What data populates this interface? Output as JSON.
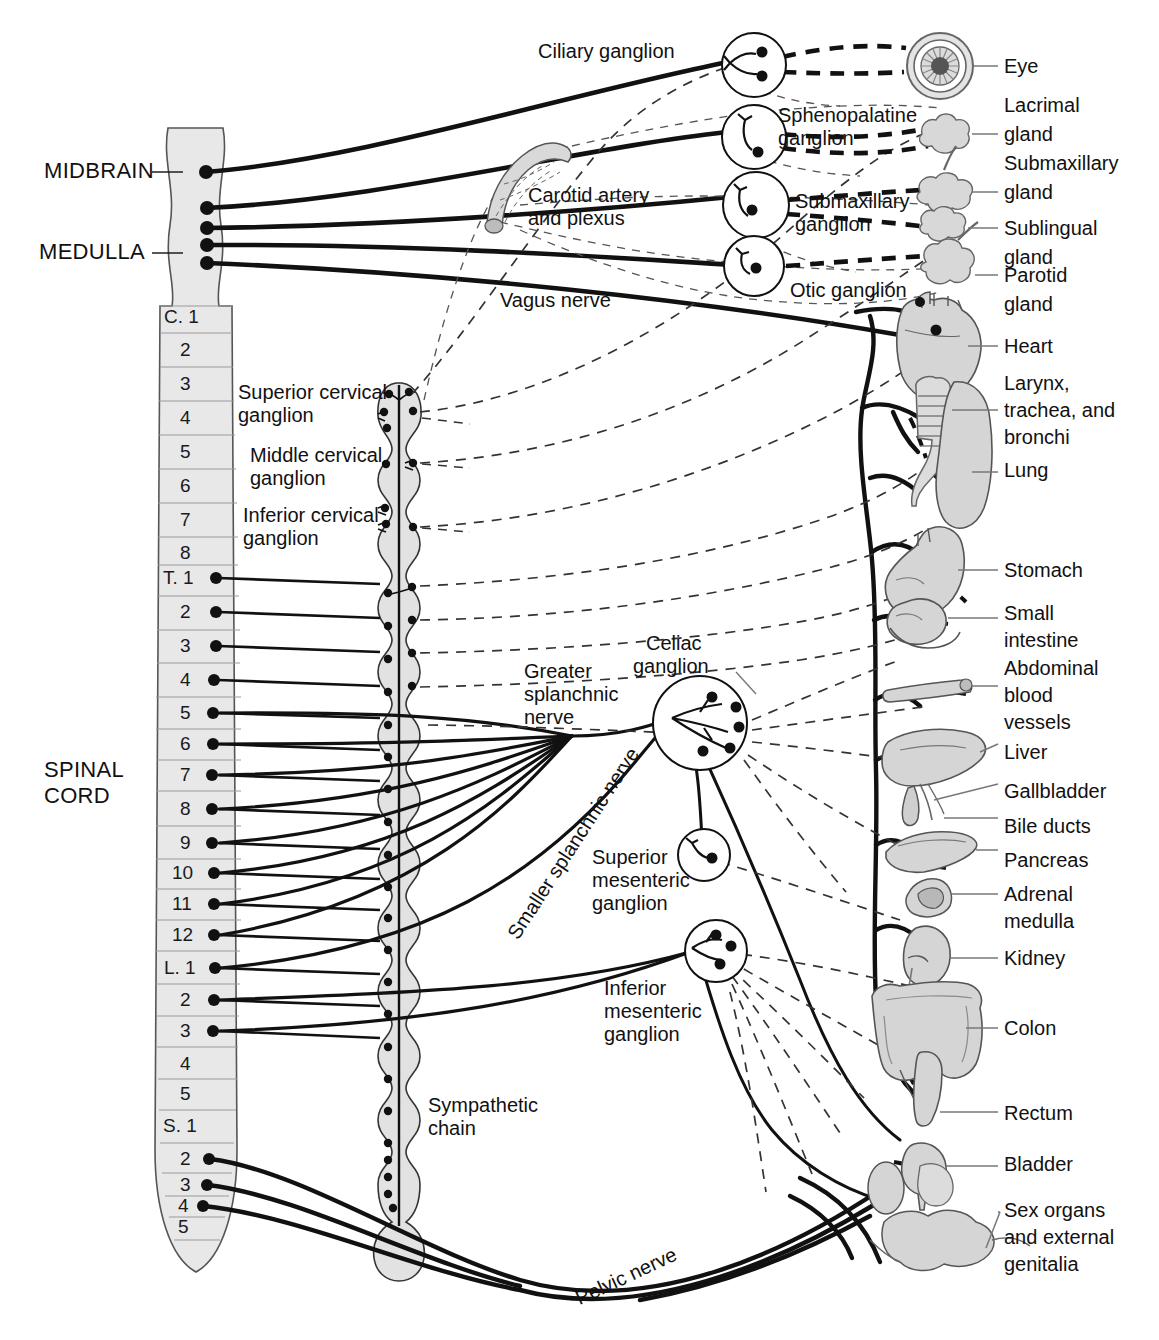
{
  "figure": {
    "colors": {
      "ink": "#111111",
      "organ_fill": "#d8d8d8",
      "organ_stroke": "#6b6b6b",
      "cord_fill": "#e6e6e6",
      "cord_stroke": "#555555",
      "leader": "#777777",
      "background": "#ffffff"
    }
  },
  "cns": {
    "midbrain_label": "MIDBRAIN",
    "medulla_label": "MEDULLA",
    "spinal_cord_label_line1": "SPINAL",
    "spinal_cord_label_line2": "CORD",
    "segments": [
      {
        "id": "c1",
        "label": "C. 1",
        "y": 317,
        "outflow": false
      },
      {
        "id": "c2",
        "label": "2",
        "y": 350,
        "outflow": false
      },
      {
        "id": "c3",
        "label": "3",
        "y": 384,
        "outflow": false
      },
      {
        "id": "c4",
        "label": "4",
        "y": 418,
        "outflow": false
      },
      {
        "id": "c5",
        "label": "5",
        "y": 452,
        "outflow": false
      },
      {
        "id": "c6",
        "label": "6",
        "y": 486,
        "outflow": false
      },
      {
        "id": "c7",
        "label": "7",
        "y": 520,
        "outflow": false
      },
      {
        "id": "c8",
        "label": "8",
        "y": 553,
        "outflow": false
      },
      {
        "id": "t1",
        "label": "T. 1",
        "y": 578,
        "outflow": true
      },
      {
        "id": "t2",
        "label": "2",
        "y": 612,
        "outflow": true
      },
      {
        "id": "t3",
        "label": "3",
        "y": 646,
        "outflow": true
      },
      {
        "id": "t4",
        "label": "4",
        "y": 680,
        "outflow": true
      },
      {
        "id": "t5",
        "label": "5",
        "y": 713,
        "outflow": true
      },
      {
        "id": "t6",
        "label": "6",
        "y": 744,
        "outflow": true
      },
      {
        "id": "t7",
        "label": "7",
        "y": 775,
        "outflow": true
      },
      {
        "id": "t8",
        "label": "8",
        "y": 809,
        "outflow": true
      },
      {
        "id": "t9",
        "label": "9",
        "y": 843,
        "outflow": true
      },
      {
        "id": "t10",
        "label": "10",
        "y": 873,
        "outflow": true
      },
      {
        "id": "t11",
        "label": "11",
        "y": 904,
        "outflow": true
      },
      {
        "id": "t12",
        "label": "12",
        "y": 935,
        "outflow": true
      },
      {
        "id": "l1",
        "label": "L. 1",
        "y": 968,
        "outflow": true
      },
      {
        "id": "l2",
        "label": "2",
        "y": 1000,
        "outflow": true
      },
      {
        "id": "l3",
        "label": "3",
        "y": 1031,
        "outflow": true
      },
      {
        "id": "l4",
        "label": "4",
        "y": 1064,
        "outflow": false
      },
      {
        "id": "l5",
        "label": "5",
        "y": 1094,
        "outflow": false
      },
      {
        "id": "s1",
        "label": "S. 1",
        "y": 1126,
        "outflow": false
      },
      {
        "id": "s2",
        "label": "2",
        "y": 1159,
        "outflow": true
      },
      {
        "id": "s3",
        "label": "3",
        "y": 1185,
        "outflow": true
      },
      {
        "id": "s4",
        "label": "4",
        "y": 1206,
        "outflow": true
      },
      {
        "id": "s5",
        "label": "5",
        "y": 1227,
        "outflow": false
      }
    ]
  },
  "ganglia": {
    "ciliary": "Ciliary ganglion",
    "sphenopalatine_l1": "Sphenopalatine",
    "sphenopalatine_l2": "ganglion",
    "submaxillary_l1": "Submaxillary",
    "submaxillary_l2": "ganglion",
    "otic": "Otic ganglion",
    "superior_cervical_l1": "Superior cervical",
    "superior_cervical_l2": "ganglion",
    "middle_cervical_l1": "Middle cervical",
    "middle_cervical_l2": "ganglion",
    "inferior_cervical_l1": "Inferior cervical",
    "inferior_cervical_l2": "ganglion",
    "celiac_l1": "Celiac",
    "celiac_l2": "ganglion",
    "superior_mesenteric_l1": "Superior",
    "superior_mesenteric_l2": "mesenteric",
    "superior_mesenteric_l3": "ganglion",
    "inferior_mesenteric_l1": "Inferior",
    "inferior_mesenteric_l2": "mesenteric",
    "inferior_mesenteric_l3": "ganglion"
  },
  "nerves": {
    "carotid_l1": "Carotid artery",
    "carotid_l2": "and plexus",
    "vagus": "Vagus nerve",
    "greater_splanchnic_l1": "Greater",
    "greater_splanchnic_l2": "splanchnic",
    "greater_splanchnic_l3": "nerve",
    "smaller_splanchnic": "Smaller splanchnic nerve",
    "sympathetic_chain_l1": "Sympathetic",
    "sympathetic_chain_l2": "chain",
    "pelvic": "Pelvic nerve"
  },
  "organs": [
    {
      "id": "eye",
      "lines": [
        "Eye"
      ],
      "y": 66
    },
    {
      "id": "lacrimal-gland",
      "lines": [
        "Lacrimal",
        "gland"
      ],
      "y": 105
    },
    {
      "id": "submaxillary-gland",
      "lines": [
        "Submaxillary",
        "gland"
      ],
      "y": 163
    },
    {
      "id": "sublingual-gland",
      "lines": [
        "Sublingual",
        "gland"
      ],
      "y": 222
    },
    {
      "id": "parotid-gland",
      "lines": [
        "Parotid",
        "gland"
      ],
      "y": 274
    },
    {
      "id": "heart",
      "lines": [
        "Heart"
      ],
      "y": 346
    },
    {
      "id": "larynx-trachea-bronchi",
      "lines": [
        "Larynx,",
        "trachea, and",
        "bronchi"
      ],
      "y": 383
    },
    {
      "id": "lung",
      "lines": [
        "Lung"
      ],
      "y": 470
    },
    {
      "id": "stomach",
      "lines": [
        "Stomach"
      ],
      "y": 570
    },
    {
      "id": "small-intestine",
      "lines": [
        "Small",
        "intestine"
      ],
      "y": 613
    },
    {
      "id": "abdominal-blood-vessels",
      "lines": [
        "Abdominal",
        "blood",
        "vessels"
      ],
      "y": 668
    },
    {
      "id": "liver",
      "lines": [
        "Liver"
      ],
      "y": 751
    },
    {
      "id": "gallbladder",
      "lines": [
        "Gallbladder"
      ],
      "y": 791
    },
    {
      "id": "bile-ducts",
      "lines": [
        "Bile ducts"
      ],
      "y": 826
    },
    {
      "id": "pancreas",
      "lines": [
        "Pancreas"
      ],
      "y": 860
    },
    {
      "id": "adrenal-medulla",
      "lines": [
        "Adrenal",
        "medulla"
      ],
      "y": 890
    },
    {
      "id": "kidney",
      "lines": [
        "Kidney"
      ],
      "y": 958
    },
    {
      "id": "colon",
      "lines": [
        "Colon"
      ],
      "y": 1022
    },
    {
      "id": "rectum",
      "lines": [
        "Rectum"
      ],
      "y": 1113
    },
    {
      "id": "bladder",
      "lines": [
        "Bladder"
      ],
      "y": 1164
    },
    {
      "id": "sex-organs",
      "lines": [
        "Sex organs",
        "and external",
        "genitalia"
      ],
      "y": 1211
    }
  ]
}
